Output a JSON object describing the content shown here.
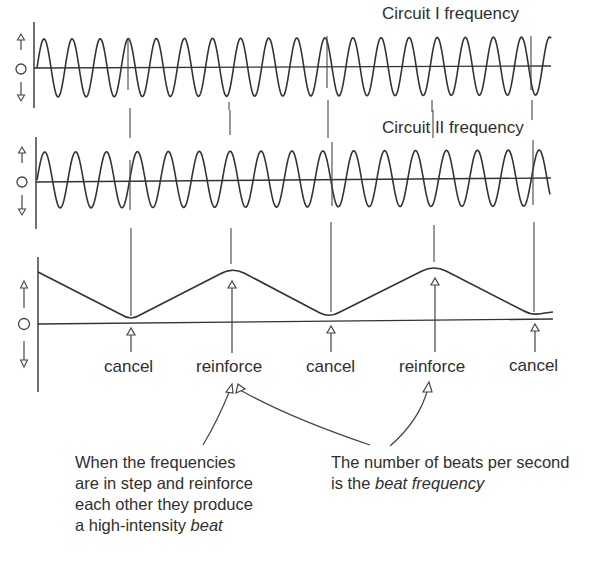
{
  "figure": {
    "panels": [
      {
        "id": "circuit-1",
        "title": "Circuit I frequency",
        "axis_symbol": "O",
        "baseline_y": 68,
        "amplitude": 29,
        "x_start": 37,
        "x_end": 551,
        "cycles": 18.3,
        "phase": "rising"
      },
      {
        "id": "circuit-2",
        "title": "Circuit II frequency",
        "axis_symbol": "O",
        "baseline_y": 180,
        "amplitude": 28,
        "x_start": 37,
        "x_end": 550,
        "cycles": 16.6,
        "phase": "rising"
      },
      {
        "id": "resultant",
        "title": "",
        "axis_symbol": "O",
        "baseline_y": 323
      }
    ],
    "markers": [
      {
        "x": 131,
        "label": "cancel"
      },
      {
        "x": 232,
        "label": "reinforce"
      },
      {
        "x": 330,
        "label": "cancel"
      },
      {
        "x": 434,
        "label": "reinforce"
      },
      {
        "x": 533,
        "label": "cancel"
      }
    ],
    "annotations": {
      "left": {
        "lines": [
          "When the frequencies",
          "are in step and reinforce",
          "each other they produce",
          "a high-intensity "
        ],
        "emphasis": "beat"
      },
      "right": {
        "lines": [
          "The number of beats per second",
          "is the "
        ],
        "emphasis": "beat frequency"
      }
    },
    "colors": {
      "ink": "#2f2f2f",
      "background": "#ffffff"
    }
  },
  "chart_data": {
    "type": "line",
    "series": [
      {
        "name": "Circuit I frequency",
        "kind": "sine",
        "cycles_visible": 18.3
      },
      {
        "name": "Circuit II frequency",
        "kind": "sine",
        "cycles_visible": 16.6
      },
      {
        "name": "Resultant amplitude envelope",
        "kind": "triangular",
        "points": [
          [
            0,
            0.82
          ],
          [
            0.18,
            0.05
          ],
          [
            0.38,
            0.88
          ],
          [
            0.57,
            0.1
          ],
          [
            0.77,
            0.9
          ],
          [
            0.97,
            0.12
          ],
          [
            1.0,
            0.12
          ]
        ]
      }
    ],
    "events": [
      "cancel",
      "reinforce",
      "cancel",
      "reinforce",
      "cancel"
    ],
    "xlabel": "",
    "ylabel": "",
    "y_axis_symbols": [
      "↑",
      "O",
      "↓"
    ],
    "grid": false,
    "legend": "none"
  }
}
